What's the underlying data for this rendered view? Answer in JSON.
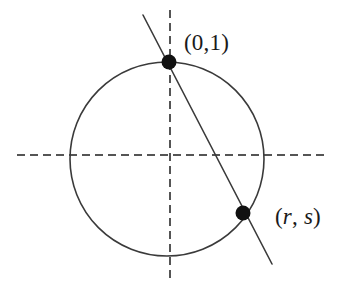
{
  "figure": {
    "kind": "geometry-diagram",
    "background_color": "#ffffff",
    "stroke_color": "#3a3a3a",
    "axis_color": "#555555",
    "point_color": "#111111",
    "label_color": "#1a1a1a"
  },
  "labels": {
    "top_point": "(0,1)",
    "bottom_point_open": "(",
    "bottom_point_r": "r",
    "bottom_point_comma": ", ",
    "bottom_point_s": "s",
    "bottom_point_close": ")"
  },
  "geometry": {
    "circle": {
      "cx": 167,
      "cy": 159,
      "r": 97
    },
    "x_axis": {
      "x1": 17,
      "y1": 155,
      "x2": 327,
      "y2": 155
    },
    "y_axis": {
      "x1": 170,
      "y1": 10,
      "x2": 170,
      "y2": 283
    },
    "secant_line": {
      "x1": 143,
      "y1": 15,
      "x2": 272,
      "y2": 264
    },
    "points": [
      {
        "name": "top-point",
        "cx": 169,
        "cy": 62,
        "r": 7.5,
        "label": "(0,1)"
      },
      {
        "name": "second-point",
        "cx": 243,
        "cy": 213,
        "r": 7.5,
        "label": "(r, s)"
      }
    ],
    "dash_pattern": "8 5"
  }
}
